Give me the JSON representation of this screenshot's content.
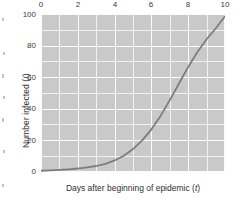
{
  "chart_data": {
    "type": "line",
    "title": "",
    "subtitle": "",
    "xlabel": "Days after beginning of epidemic (t)",
    "xlabel_text": "Days after beginning of epidemic",
    "xlabel_symbol": "t",
    "ylabel": "Number infected (I)",
    "ylabel_text": "Number infected",
    "ylabel_symbol": "I",
    "xlim": [
      0,
      10
    ],
    "ylim": [
      0,
      100
    ],
    "xticks": [
      0,
      2,
      4,
      6,
      8,
      10
    ],
    "xtick_labels": [
      "0",
      "2",
      "4",
      "6",
      "8",
      "10"
    ],
    "yticks": [
      0,
      20,
      40,
      60,
      80,
      100
    ],
    "ytick_labels": [
      "0",
      "20",
      "40",
      "60",
      "80",
      "100"
    ],
    "x_minor_step": 1,
    "y_minor_step": 10,
    "grid": true,
    "grid_color": "#fbfbfb",
    "plot_bg_color": "#c9c9c9",
    "figure_bg_color": "#ffffff",
    "legend": null,
    "legend_position": "none",
    "series": [
      {
        "name": "Number infected",
        "color": "#7d7d7d",
        "line_width": 1.8,
        "x": [
          0,
          0.5,
          1,
          1.5,
          2,
          2.5,
          3,
          3.5,
          4,
          4.5,
          5,
          5.5,
          6,
          6.5,
          7,
          7.5,
          8,
          8.5,
          9,
          9.5,
          10
        ],
        "values": [
          0.8,
          1.0,
          1.3,
          1.7,
          2.2,
          2.9,
          3.8,
          5.2,
          7.3,
          10.3,
          14.5,
          20.0,
          27.0,
          35.5,
          45.5,
          56.0,
          66.5,
          76.0,
          84.0,
          91.0,
          98.5
        ]
      }
    ],
    "annotations": []
  }
}
